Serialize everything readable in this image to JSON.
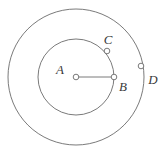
{
  "figure": {
    "type": "geometry-diagram",
    "background_color": "#ffffff",
    "stroke_color": "#6b6b6b",
    "label_color": "#3a3a3a",
    "marker_fill": "#ffffff",
    "center": {
      "x": 76,
      "y": 77
    },
    "circles": [
      {
        "name": "outer-circle",
        "cx": 76,
        "cy": 77,
        "r": 68
      },
      {
        "name": "inner-circle",
        "cx": 76,
        "cy": 77,
        "r": 38
      }
    ],
    "points": [
      {
        "id": "A",
        "label": "A",
        "x": 76,
        "y": 77,
        "label_x": 60,
        "label_y": 69,
        "on": "center"
      },
      {
        "id": "B",
        "label": "B",
        "x": 114,
        "y": 77,
        "label_x": 123,
        "label_y": 86,
        "on": "inner-circle"
      },
      {
        "id": "C",
        "label": "C",
        "x": 107,
        "y": 51,
        "label_x": 108,
        "label_y": 39,
        "on": "inner-circle"
      },
      {
        "id": "D",
        "label": "D",
        "x": 141,
        "y": 66,
        "label_x": 153,
        "label_y": 79,
        "on": "outer-circle"
      }
    ],
    "segments": [
      {
        "name": "segment-ab",
        "from": "A",
        "to": "B",
        "x1": 76,
        "y1": 77,
        "x2": 114,
        "y2": 77
      }
    ],
    "marker_radius": 3
  }
}
